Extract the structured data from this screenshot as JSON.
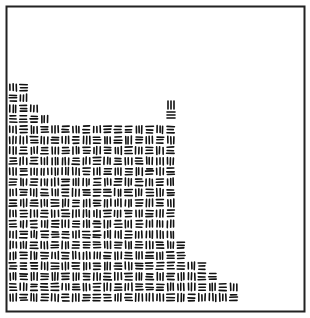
{
  "image": {
    "description": "Basket-weave texture of short parallel stroke triplets inside a rectangular frame; texture fills a stepped region in the lower-left",
    "colors": {
      "background": "#ffffff",
      "stroke": "#111111",
      "frame": "#222222"
    },
    "pattern": {
      "unit": "triplet-of-strokes",
      "orientations": [
        "horizontal",
        "vertical"
      ],
      "arrangement": "alternating checkerboard"
    }
  }
}
